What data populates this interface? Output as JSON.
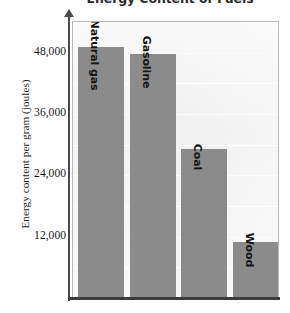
{
  "chart_data": {
    "type": "bar",
    "title": "Energy Content of Fuels",
    "xlabel": "",
    "ylabel": "Energy content per gram (joules)",
    "categories": [
      "Natural gas",
      "Gasoline",
      "Coal",
      "Wood"
    ],
    "values": [
      49000,
      47500,
      29000,
      10700
    ],
    "ylim": [
      0,
      54000
    ],
    "yticks": [
      12000,
      24000,
      36000,
      48000
    ],
    "ytick_labels": [
      "12,000",
      "24,000",
      "36,000",
      "48,000"
    ],
    "grid": true,
    "grid_orientation": "horizontal",
    "legend": "none",
    "bar_color": "#8b8b8b",
    "plot_background": "#f2f2f2",
    "bar_label_position": "inside-top-rotated"
  },
  "axis": {
    "y_title": "Energy content per gram (joules)",
    "ticks": [
      {
        "label": "48,000",
        "value": 48000
      },
      {
        "label": "36,000",
        "value": 36000
      },
      {
        "label": "24,000",
        "value": 24000
      },
      {
        "label": "12,000",
        "value": 12000
      }
    ]
  },
  "bars": [
    {
      "label": "Natural gas",
      "value": 49000
    },
    {
      "label": "Gasoline",
      "value": 47500
    },
    {
      "label": "Coal",
      "value": 29000
    },
    {
      "label": "Wood",
      "value": 10700
    }
  ]
}
